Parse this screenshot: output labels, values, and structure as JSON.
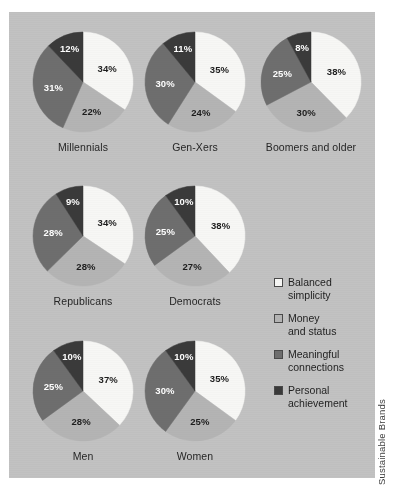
{
  "colors": {
    "panel_background": "#c2c2c2",
    "page_background": "#ffffff",
    "balanced_simplicity": "#f7f7f5",
    "money_and_status": "#b4b4b4",
    "meaningful_connections": "#6e6e6e",
    "personal_achievement": "#3a3a3a",
    "label_dark": "#1d1d1d",
    "label_light": "#ffffff"
  },
  "legend": {
    "name": "chart-legend",
    "items": [
      {
        "label": "Balanced simplicity",
        "line1": "Balanced",
        "line2": "simplicity",
        "color": "#f7f7f5"
      },
      {
        "label": "Money and status",
        "line1": "Money",
        "line2": "and status",
        "color": "#b4b4b4"
      },
      {
        "label": "Meaningful connections",
        "line1": "Meaningful",
        "line2": "connections",
        "color": "#6e6e6e"
      },
      {
        "label": "Personal achievement",
        "line1": "Personal",
        "line2": "achievement",
        "color": "#3a3a3a"
      }
    ]
  },
  "credit": {
    "text": "Sustainable Brands"
  },
  "chart_data": {
    "type": "pie",
    "title": "",
    "categories": [
      "Balanced simplicity",
      "Money and status",
      "Meaningful connections",
      "Personal achievement"
    ],
    "category_colors": [
      "#f7f7f5",
      "#b4b4b4",
      "#6e6e6e",
      "#3a3a3a"
    ],
    "start_angle_deg": 0,
    "direction": "clockwise",
    "value_unit": "%",
    "legend_position": "right",
    "charts": [
      {
        "name": "millennials",
        "label": "Millennials",
        "values": [
          34,
          22,
          31,
          12
        ],
        "value_labels": [
          "34%",
          "22%",
          "31%",
          "12%"
        ]
      },
      {
        "name": "gen-xers",
        "label": "Gen-Xers",
        "values": [
          35,
          24,
          30,
          11
        ],
        "value_labels": [
          "35%",
          "24%",
          "30%",
          "11%"
        ]
      },
      {
        "name": "boomers-and-older",
        "label": "Boomers and older",
        "values": [
          38,
          30,
          25,
          8
        ],
        "value_labels": [
          "38%",
          "30%",
          "25%",
          "8%"
        ]
      },
      {
        "name": "republicans",
        "label": "Republicans",
        "values": [
          34,
          28,
          28,
          9
        ],
        "value_labels": [
          "34%",
          "28%",
          "28%",
          "9%"
        ]
      },
      {
        "name": "democrats",
        "label": "Democrats",
        "values": [
          38,
          27,
          25,
          10
        ],
        "value_labels": [
          "38%",
          "27%",
          "25%",
          "10%"
        ]
      },
      {
        "name": "men",
        "label": "Men",
        "values": [
          37,
          28,
          25,
          10
        ],
        "value_labels": [
          "37%",
          "28%",
          "25%",
          "10%"
        ]
      },
      {
        "name": "women",
        "label": "Women",
        "values": [
          35,
          25,
          30,
          10
        ],
        "value_labels": [
          "35%",
          "25%",
          "30%",
          "10%"
        ]
      }
    ]
  }
}
